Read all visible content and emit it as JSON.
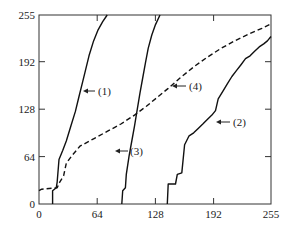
{
  "chart_data": {
    "type": "line",
    "title": "",
    "xlabel": "",
    "ylabel": "",
    "xlim": [
      0,
      255
    ],
    "ylim": [
      0,
      255
    ],
    "grid": false,
    "x_ticks": [
      "0",
      "64",
      "128",
      "192",
      "255"
    ],
    "y_ticks": [
      "0",
      "64",
      "128",
      "192",
      "255"
    ],
    "series": [
      {
        "name": "(1)",
        "style": "solid",
        "points": [
          [
            15,
            0
          ],
          [
            15,
            18
          ],
          [
            19,
            22
          ],
          [
            20,
            30
          ],
          [
            22,
            60
          ],
          [
            26,
            72
          ],
          [
            30,
            85
          ],
          [
            35,
            105
          ],
          [
            40,
            125
          ],
          [
            44,
            145
          ],
          [
            48,
            165
          ],
          [
            51,
            180
          ],
          [
            55,
            200
          ],
          [
            60,
            220
          ],
          [
            65,
            235
          ],
          [
            70,
            246
          ],
          [
            75,
            255
          ]
        ]
      },
      {
        "name": "(2)",
        "style": "solid",
        "points": [
          [
            141,
            0
          ],
          [
            142,
            27
          ],
          [
            150,
            27
          ],
          [
            152,
            40
          ],
          [
            157,
            42
          ],
          [
            160,
            80
          ],
          [
            165,
            92
          ],
          [
            170,
            96
          ],
          [
            175,
            102
          ],
          [
            180,
            108
          ],
          [
            185,
            114
          ],
          [
            190,
            120
          ],
          [
            194,
            126
          ],
          [
            197,
            142
          ],
          [
            202,
            152
          ],
          [
            207,
            162
          ],
          [
            212,
            172
          ],
          [
            217,
            180
          ],
          [
            222,
            188
          ],
          [
            227,
            196
          ],
          [
            232,
            200
          ],
          [
            237,
            206
          ],
          [
            242,
            212
          ],
          [
            247,
            216
          ],
          [
            251,
            220
          ],
          [
            255,
            226
          ]
        ]
      },
      {
        "name": "(3)",
        "style": "solid",
        "points": [
          [
            91,
            0
          ],
          [
            92,
            18
          ],
          [
            95,
            22
          ],
          [
            96,
            40
          ],
          [
            99,
            65
          ],
          [
            102,
            85
          ],
          [
            105,
            105
          ],
          [
            108,
            128
          ],
          [
            111,
            150
          ],
          [
            114,
            170
          ],
          [
            117,
            190
          ],
          [
            120,
            210
          ],
          [
            124,
            228
          ],
          [
            128,
            242
          ],
          [
            133,
            255
          ]
        ]
      },
      {
        "name": "(4)",
        "style": "dashed",
        "points": [
          [
            0,
            18
          ],
          [
            3,
            20
          ],
          [
            20,
            22
          ],
          [
            23,
            30
          ],
          [
            27,
            38
          ],
          [
            30,
            55
          ],
          [
            36,
            65
          ],
          [
            45,
            78
          ],
          [
            60,
            88
          ],
          [
            75,
            98
          ],
          [
            90,
            108
          ],
          [
            105,
            120
          ],
          [
            118,
            132
          ],
          [
            130,
            144
          ],
          [
            142,
            156
          ],
          [
            155,
            170
          ],
          [
            170,
            185
          ],
          [
            185,
            198
          ],
          [
            200,
            210
          ],
          [
            215,
            220
          ],
          [
            230,
            229
          ],
          [
            245,
            237
          ],
          [
            255,
            243
          ]
        ]
      }
    ],
    "annotations": [
      {
        "text": "(1)",
        "arrow_to": [
          48,
          155
        ]
      },
      {
        "text": "(2)",
        "arrow_to": [
          197,
          125
        ]
      },
      {
        "text": "(3)",
        "arrow_to": [
          103,
          72
        ]
      },
      {
        "text": "(4)",
        "arrow_to": [
          145,
          160
        ]
      }
    ]
  },
  "axes": {
    "x_ticks": [
      "0",
      "64",
      "128",
      "192",
      "255"
    ],
    "y_ticks": [
      "0",
      "64",
      "128",
      "192",
      "255"
    ]
  },
  "labels": {
    "c1": "(1)",
    "c2": "(2)",
    "c3": "(3)",
    "c4": "(4)"
  }
}
